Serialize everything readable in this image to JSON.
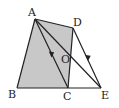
{
  "diagram": {
    "labels": {
      "A": "A",
      "B": "B",
      "C": "C",
      "D": "D",
      "E": "E",
      "O": "O"
    },
    "points": {
      "A": [
        35,
        19
      ],
      "B": [
        17,
        88
      ],
      "C": [
        68,
        88
      ],
      "D": [
        73,
        28
      ],
      "E": [
        101,
        88
      ],
      "O": [
        70,
        56
      ]
    },
    "shaded_region": [
      "A",
      "B",
      "C",
      "D"
    ],
    "segments": [
      [
        "A",
        "B"
      ],
      [
        "B",
        "C"
      ],
      [
        "C",
        "E"
      ],
      [
        "A",
        "D"
      ],
      [
        "D",
        "C"
      ],
      [
        "A",
        "C"
      ],
      [
        "A",
        "E"
      ],
      [
        "D",
        "E"
      ]
    ],
    "parallel_arrows": [
      [
        "A",
        "C"
      ],
      [
        "D",
        "E"
      ]
    ],
    "colors": {
      "fill": "#c8c8c8",
      "stroke": "#222222"
    }
  }
}
